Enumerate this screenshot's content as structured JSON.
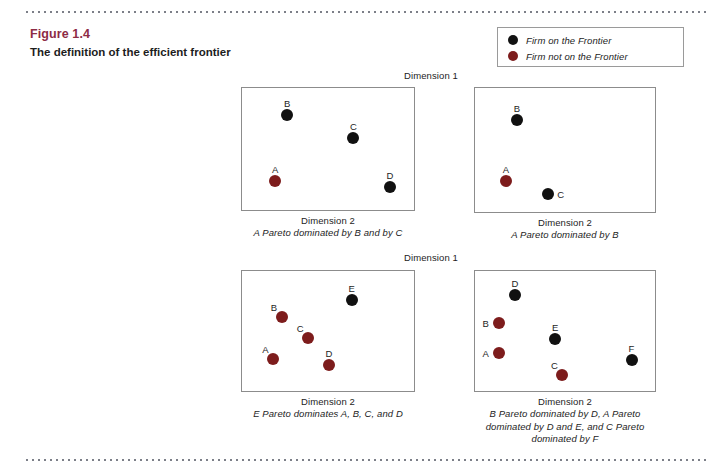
{
  "figure": {
    "number": "Figure 1.4",
    "caption": "The definition of the efficient frontier"
  },
  "legend": {
    "items": [
      {
        "label": "Firm on the Frontier",
        "marker": "black-dot",
        "color": "#121212"
      },
      {
        "label": "Firm not on the Frontier",
        "marker": "dark-red-dot",
        "color": "#7d1c1c"
      }
    ]
  },
  "axis_labels": {
    "dimension1": "Dimension 1",
    "dimension2": "Dimension 2"
  },
  "chart_data": {
    "type": "scatter",
    "title": "The definition of the efficient frontier",
    "xlabel": "Dimension 2",
    "ylabel": "Dimension 1",
    "xlim": [
      0,
      100
    ],
    "ylim": [
      0,
      100
    ],
    "grid": false,
    "legend_position": "top-right",
    "series": [
      {
        "name": "Firm on the Frontier",
        "color": "#121212"
      },
      {
        "name": "Firm not on the Frontier",
        "color": "#7d1c1c"
      }
    ],
    "panels": [
      {
        "id": "panel-top-left",
        "caption": "A Pareto dominated by B and by C",
        "points": [
          {
            "label": "B",
            "x": 26,
            "y": 78,
            "frontier": true,
            "label_pos": "above"
          },
          {
            "label": "C",
            "x": 64,
            "y": 60,
            "frontier": true,
            "label_pos": "above"
          },
          {
            "label": "A",
            "x": 19,
            "y": 25,
            "frontier": false,
            "label_pos": "above"
          },
          {
            "label": "D",
            "x": 85,
            "y": 20,
            "frontier": true,
            "label_pos": "above"
          }
        ]
      },
      {
        "id": "panel-top-right",
        "caption": "A Pareto dominated by B",
        "points": [
          {
            "label": "B",
            "x": 23,
            "y": 75,
            "frontier": true,
            "label_pos": "above"
          },
          {
            "label": "A",
            "x": 17,
            "y": 26,
            "frontier": false,
            "label_pos": "above"
          },
          {
            "label": "C",
            "x": 40,
            "y": 16,
            "frontier": true,
            "label_pos": "right"
          }
        ]
      },
      {
        "id": "panel-bottom-left",
        "caption": "E Pareto dominates A, B, C, and D",
        "points": [
          {
            "label": "E",
            "x": 63,
            "y": 76,
            "frontier": true,
            "label_pos": "above"
          },
          {
            "label": "B",
            "x": 23,
            "y": 62,
            "frontier": false,
            "label_pos": "above-left"
          },
          {
            "label": "C",
            "x": 38,
            "y": 45,
            "frontier": false,
            "label_pos": "above-left"
          },
          {
            "label": "A",
            "x": 18,
            "y": 28,
            "frontier": false,
            "label_pos": "above-left"
          },
          {
            "label": "D",
            "x": 50,
            "y": 23,
            "frontier": false,
            "label_pos": "above"
          }
        ]
      },
      {
        "id": "panel-bottom-right",
        "caption": "B Pareto dominated by D, A Pareto dominated by D and E, and C Pareto dominated by F",
        "points": [
          {
            "label": "D",
            "x": 22,
            "y": 80,
            "frontier": true,
            "label_pos": "above"
          },
          {
            "label": "B",
            "x": 13,
            "y": 57,
            "frontier": false,
            "label_pos": "left"
          },
          {
            "label": "E",
            "x": 44,
            "y": 44,
            "frontier": true,
            "label_pos": "above"
          },
          {
            "label": "A",
            "x": 13,
            "y": 33,
            "frontier": false,
            "label_pos": "left"
          },
          {
            "label": "F",
            "x": 86,
            "y": 27,
            "frontier": true,
            "label_pos": "above"
          },
          {
            "label": "C",
            "x": 48,
            "y": 15,
            "frontier": false,
            "label_pos": "above-left"
          }
        ]
      }
    ]
  }
}
